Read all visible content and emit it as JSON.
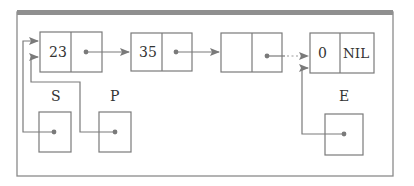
{
  "diagram": {
    "type": "linked-list",
    "colors": {
      "frame": "#8a8a8a",
      "frame_top_bar": "#8f8f8f",
      "line": "#7a7a7a",
      "text": "#333333",
      "background": "#ffffff"
    },
    "nodes": [
      {
        "id": "node-1",
        "value": "23",
        "next": "node-2"
      },
      {
        "id": "node-2",
        "value": "35",
        "next": "node-3"
      },
      {
        "id": "node-3",
        "value": "",
        "next": "node-4",
        "next_style": "dotted"
      },
      {
        "id": "node-4",
        "value": "0",
        "next_label": "NIL"
      }
    ],
    "pointers": [
      {
        "id": "S",
        "label": "S",
        "points_to": "node-1"
      },
      {
        "id": "P",
        "label": "P",
        "points_to": "node-1"
      },
      {
        "id": "E",
        "label": "E",
        "points_to": "node-4"
      }
    ]
  }
}
